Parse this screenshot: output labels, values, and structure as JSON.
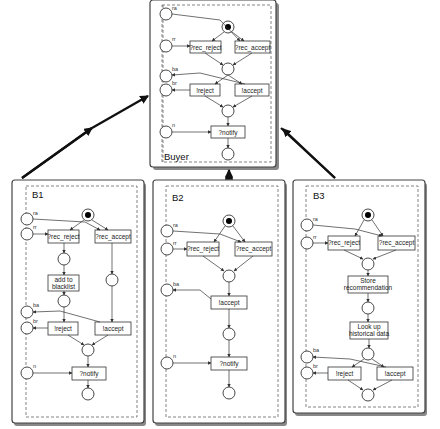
{
  "diagram": {
    "type": "petri-net-composition",
    "buyer": {
      "title": "Buyer",
      "places": [
        "ra",
        "rr",
        "ba",
        "br",
        "n"
      ],
      "transitions": [
        "?rec_reject",
        "?rec_accept",
        "!reject",
        "!accept",
        "?notify"
      ]
    },
    "b1": {
      "title": "B1",
      "places": [
        "ra",
        "rr",
        "ba",
        "br",
        "n"
      ],
      "transitions": [
        "?rec_reject",
        "?rec_accept",
        "add to",
        "blacklist",
        "!reject",
        "!accept",
        "?notify"
      ]
    },
    "b2": {
      "title": "B2",
      "places": [
        "ra",
        "rr",
        "ba",
        "n"
      ],
      "transitions": [
        "?rec_reject",
        "?rec_accept",
        "!accept",
        "?notify"
      ]
    },
    "b3": {
      "title": "B3",
      "places": [
        "ra",
        "rr",
        "ba",
        "br"
      ],
      "transitions": [
        "?rec_reject",
        "?rec_accept",
        "Store",
        "recommendation",
        "Look up",
        "historical data",
        "!reject",
        "!accept"
      ]
    }
  }
}
